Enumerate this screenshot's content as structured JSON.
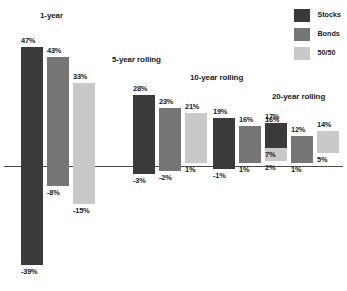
{
  "chart_data": {
    "type": "bar",
    "title": "",
    "xlabel": "",
    "ylabel": "",
    "grid": false,
    "legend_position": "top-right",
    "axis_zero": 0,
    "value_unit": "%",
    "categories": [
      "1-year",
      "5-year rolling",
      "10-year rolling",
      "20-year rolling"
    ],
    "series": [
      {
        "name": "Stocks",
        "color": "#3a3a3a",
        "max": [
          47,
          28,
          19,
          17
        ],
        "min": [
          -39,
          -3,
          -1,
          7
        ]
      },
      {
        "name": "Bonds",
        "color": "#767676",
        "max": [
          43,
          23,
          16,
          12
        ],
        "min": [
          -8,
          -2,
          1,
          1
        ]
      },
      {
        "name": "50/50",
        "color": "#c9c9c9",
        "max": [
          33,
          21,
          16,
          14
        ],
        "min": [
          -15,
          1,
          2,
          5
        ]
      }
    ],
    "groups": [
      {
        "label": "1-year",
        "bars": [
          {
            "series": "Stocks",
            "high": 47,
            "low": -39,
            "high_label": "47%",
            "low_label": "-39%"
          },
          {
            "series": "Bonds",
            "high": 43,
            "low": -8,
            "high_label": "43%",
            "low_label": "-8%"
          },
          {
            "series": "50/50",
            "high": 33,
            "low": -15,
            "high_label": "33%",
            "low_label": "-15%"
          }
        ]
      },
      {
        "label": "5-year rolling",
        "bars": [
          {
            "series": "Stocks",
            "high": 28,
            "low": -3,
            "high_label": "28%",
            "low_label": "-3%"
          },
          {
            "series": "Bonds",
            "high": 23,
            "low": -2,
            "high_label": "23%",
            "low_label": "-2%"
          },
          {
            "series": "50/50",
            "high": 21,
            "low": 1,
            "high_label": "21%",
            "low_label": "1%"
          }
        ]
      },
      {
        "label": "10-year rolling",
        "bars": [
          {
            "series": "Stocks",
            "high": 19,
            "low": -1,
            "high_label": "19%",
            "low_label": "-1%"
          },
          {
            "series": "Bonds",
            "high": 16,
            "low": 1,
            "high_label": "16%",
            "low_label": "1%"
          },
          {
            "series": "50/50",
            "high": 16,
            "low": 2,
            "high_label": "16%",
            "low_label": "2%"
          }
        ]
      },
      {
        "label": "20-year rolling",
        "bars": [
          {
            "series": "Stocks",
            "high": 17,
            "low": 7,
            "high_label": "17%",
            "low_label": "7%"
          },
          {
            "series": "Bonds",
            "high": 12,
            "low": 1,
            "high_label": "12%",
            "low_label": "1%"
          },
          {
            "series": "50/50",
            "high": 14,
            "low": 5,
            "high_label": "14%",
            "low_label": "5%"
          }
        ]
      }
    ]
  },
  "legend": {
    "items": [
      {
        "label": "Stocks",
        "color": "#3a3a3a"
      },
      {
        "label": "Bonds",
        "color": "#767676"
      },
      {
        "label": "50/50",
        "color": "#c9c9c9"
      }
    ]
  },
  "layout": {
    "axis_y": 166,
    "px_per_pct": 2.53,
    "bar_width": 22,
    "bar_gap": 4,
    "group_x": [
      21,
      133,
      213,
      265
    ],
    "group_title_y": [
      12,
      56,
      74,
      93
    ],
    "group_title_x": [
      40,
      112,
      190,
      272
    ],
    "axis_color": "#4a4a4a"
  }
}
